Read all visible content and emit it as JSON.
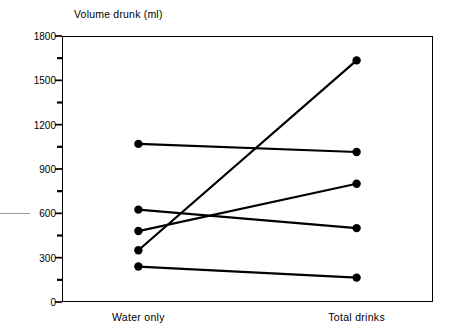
{
  "chart_data": {
    "type": "line",
    "title": "Volume drunk (ml)",
    "subtitle": "",
    "xlabel": "",
    "ylabel": "Volume drunk (ml)",
    "categories": [
      "Water only",
      "Total drinks"
    ],
    "x": [
      0,
      1
    ],
    "ylim": [
      0,
      1800
    ],
    "xlim": [
      -0.35,
      1.35
    ],
    "y_major_ticks": [
      0,
      300,
      600,
      900,
      1200,
      1500,
      1800
    ],
    "y_minor_ticks": [
      150,
      450,
      750,
      1050,
      1350,
      1650
    ],
    "y_tick_labels": [
      "0",
      "300",
      "600",
      "900",
      "1200",
      "1500",
      "1800"
    ],
    "grid": false,
    "legend": false,
    "legend_position": "none",
    "marker": "filled-circle",
    "line_color": "#000000",
    "marker_color": "#000000",
    "series": [
      {
        "name": "Subject 1",
        "values": [
          1070,
          1015
        ]
      },
      {
        "name": "Subject 2",
        "values": [
          625,
          500
        ]
      },
      {
        "name": "Subject 3",
        "values": [
          480,
          800
        ]
      },
      {
        "name": "Subject 4",
        "values": [
          350,
          1635
        ]
      },
      {
        "name": "Subject 5",
        "values": [
          240,
          165
        ]
      }
    ],
    "annotations": []
  },
  "chart": {
    "title": "Volume drunk (ml)",
    "axis": {
      "y_labels": [
        "1800",
        "1500",
        "1200",
        "900",
        "600",
        "300",
        "0"
      ],
      "y_values": [
        1800,
        1500,
        1200,
        900,
        600,
        300,
        0
      ]
    },
    "x_labels": [
      "Water only",
      "Total drinks"
    ]
  }
}
